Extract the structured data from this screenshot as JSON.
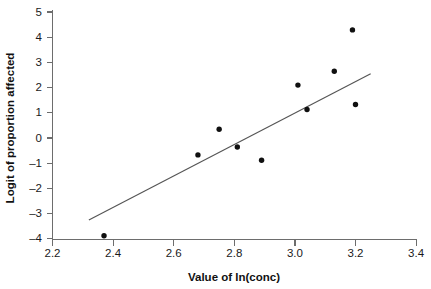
{
  "chart_data": {
    "type": "scatter",
    "title": "",
    "xlabel": "Value of ln(conc)",
    "ylabel": "Logit of proportion affected",
    "xlim": [
      2.2,
      3.4
    ],
    "ylim": [
      -4,
      5
    ],
    "xticks": [
      "2.2",
      "2.4",
      "2.6",
      "2.8",
      "3.0",
      "3.2",
      "3.4"
    ],
    "xtick_values": [
      2.2,
      2.4,
      2.6,
      2.8,
      3.0,
      3.2,
      3.4
    ],
    "yticks": [
      "5",
      "4",
      "3",
      "2",
      "1",
      "0",
      "–1",
      "–2",
      "–3",
      "–4"
    ],
    "ytick_values": [
      5,
      4,
      3,
      2,
      1,
      0,
      -1,
      -2,
      -3,
      -4
    ],
    "grid": false,
    "legend": false,
    "legend_position": "none",
    "marker": "filled-square-dot",
    "marker_color": "#101010",
    "points": [
      {
        "x": 2.37,
        "y": -3.88
      },
      {
        "x": 2.68,
        "y": -0.67
      },
      {
        "x": 2.75,
        "y": 0.35
      },
      {
        "x": 2.81,
        "y": -0.36
      },
      {
        "x": 2.89,
        "y": -0.88
      },
      {
        "x": 3.01,
        "y": 2.1
      },
      {
        "x": 3.04,
        "y": 1.13
      },
      {
        "x": 3.13,
        "y": 2.65
      },
      {
        "x": 3.19,
        "y": 4.29
      },
      {
        "x": 3.2,
        "y": 1.33
      }
    ],
    "series": [
      {
        "name": "Observed logits",
        "type": "scatter",
        "x": [
          2.37,
          2.68,
          2.75,
          2.81,
          2.89,
          3.01,
          3.04,
          3.13,
          3.19,
          3.2
        ],
        "values": [
          -3.88,
          -0.67,
          0.35,
          -0.36,
          -0.88,
          2.1,
          1.13,
          2.65,
          4.29,
          1.33
        ]
      },
      {
        "name": "Fitted regression line",
        "type": "line",
        "x": [
          2.32,
          3.25
        ],
        "values": [
          -3.25,
          2.55
        ]
      }
    ],
    "fit_line": {
      "x_start": 2.32,
      "y_start": -3.25,
      "x_end": 3.25,
      "y_end": 2.55,
      "slope": 6.24,
      "intercept": -17.73,
      "color": "#555555"
    },
    "annotations": []
  },
  "axes": {
    "x_axis_label": "Value of ln(conc)",
    "y_axis_label": "Logit of proportion affected",
    "axis_color": "#6d6d6d"
  }
}
